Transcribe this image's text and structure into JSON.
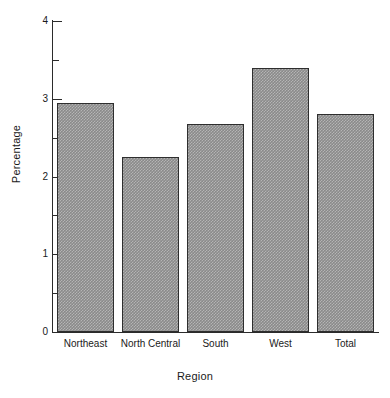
{
  "chart_data": {
    "type": "bar",
    "title": "",
    "xlabel": "Region",
    "ylabel": "Percentage",
    "categories": [
      "Northeast",
      "North Central",
      "South",
      "West",
      "Total"
    ],
    "values": [
      2.95,
      2.25,
      2.67,
      3.4,
      2.8
    ],
    "ylim": [
      0,
      4
    ],
    "ytick_labels": [
      "0",
      "1",
      "2",
      "3",
      "4"
    ],
    "ytick_values": [
      0,
      1,
      2,
      3,
      4
    ],
    "yminor_tick_values": [
      0.5,
      1.5,
      2.5,
      3.5
    ],
    "grid": false,
    "legend": null,
    "bar_fill_color": "#8a8a8a",
    "bar_edge_color": "#2e2e2e",
    "axis_color": "#2b2b2b",
    "background_color": "#ffffff"
  }
}
